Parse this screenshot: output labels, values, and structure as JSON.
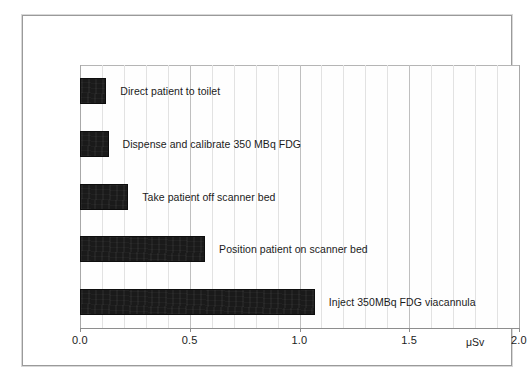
{
  "chart_data": {
    "type": "bar",
    "orientation": "horizontal",
    "title": "",
    "subtitle": "",
    "xlabel": "μSv",
    "ylabel": "",
    "xlim": [
      0.0,
      2.0
    ],
    "xticks": [
      "0.0",
      "0.5",
      "1.0",
      "1.5",
      "2.0"
    ],
    "xtick_values": [
      0.0,
      0.5,
      1.0,
      1.5,
      2.0
    ],
    "grid": true,
    "gridline_step": 0.1,
    "legend": "none",
    "bar_color": "#1a1a1a",
    "categories": [
      "Direct patient to toilet",
      "Dispense and calibrate 350 MBq FDG",
      "Take patient off scanner bed",
      "Position patient on scanner bed",
      "Inject 350MBq FDG viacannula"
    ],
    "values": [
      0.12,
      0.13,
      0.22,
      0.57,
      1.07
    ],
    "bars": [
      {
        "label": "Direct patient to toilet",
        "value": 0.12
      },
      {
        "label": "Dispense and calibrate 350 MBq FDG",
        "value": 0.13
      },
      {
        "label": "Take patient off scanner bed",
        "value": 0.22
      },
      {
        "label": "Position patient on scanner bed",
        "value": 0.57
      },
      {
        "label": "Inject 350MBq FDG viacannula",
        "value": 1.07
      }
    ]
  },
  "axis": {
    "unit_label": "μSv",
    "unit_position": 1.8,
    "tick_labels": [
      "0.0",
      "0.5",
      "1.0",
      "1.5",
      "2.0"
    ]
  }
}
